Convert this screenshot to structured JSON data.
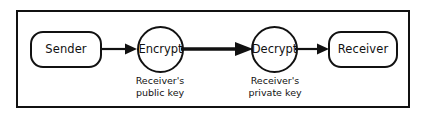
{
  "diagram": {
    "stroke_color": "#111111",
    "background_color": "#ffffff",
    "nodes": [
      {
        "id": "sender",
        "label": "Sender",
        "shape": "rounded-rectangle"
      },
      {
        "id": "encrypt",
        "label": "Encrypt",
        "shape": "circle"
      },
      {
        "id": "decrypt",
        "label": "Decrypt",
        "shape": "circle"
      },
      {
        "id": "receiver",
        "label": "Receiver",
        "shape": "rounded-rectangle"
      }
    ],
    "captions": [
      {
        "id": "encrypt-key",
        "line1": "Receiver's",
        "line2": "public key"
      },
      {
        "id": "decrypt-key",
        "line1": "Receiver's",
        "line2": "private key"
      }
    ],
    "arrows": [
      {
        "id": "sender-to-encrypt",
        "from": "sender",
        "to": "encrypt",
        "weight": "thin",
        "direction": "right"
      },
      {
        "id": "encrypt-to-decrypt",
        "from": "encrypt",
        "to": "decrypt",
        "weight": "thick",
        "direction": "right"
      },
      {
        "id": "decrypt-to-receiver",
        "from": "decrypt",
        "to": "receiver",
        "weight": "thin",
        "direction": "right"
      }
    ]
  }
}
